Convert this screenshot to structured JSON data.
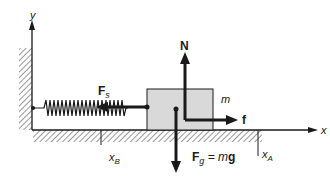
{
  "diagram": {
    "labels": {
      "y_axis": "y",
      "x_axis": "x",
      "spring_force": "F",
      "spring_force_sub": "s",
      "normal_force": "N",
      "mass": "m",
      "friction": "f",
      "gravity_lhs": "F",
      "gravity_sub": "g",
      "gravity_rhs": " = m",
      "gravity_g": "g",
      "x_b": "x",
      "x_b_sub": "B",
      "x_a": "x",
      "x_a_sub": "A"
    },
    "colors": {
      "block_fill": "#d9d9d9",
      "stroke": "#1a1a1a"
    }
  }
}
